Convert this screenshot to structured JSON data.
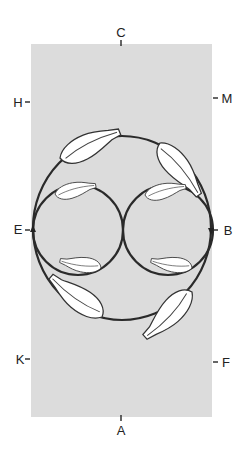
{
  "diagram": {
    "type": "dressage-arena",
    "figure": "large circle containing two half-arena circles (figure-of-eight) with horse silhouettes tracking along the paths",
    "colors": {
      "arena_fill": "#dcdcdc",
      "path_stroke": "#2a2a2a",
      "horse_fill": "#ffffff",
      "horse_stroke": "#333333",
      "letter_color": "#222222"
    },
    "markers": {
      "C": "C",
      "H": "H",
      "M": "M",
      "E": "E",
      "B": "B",
      "K": "K",
      "F": "F",
      "A": "A"
    }
  }
}
